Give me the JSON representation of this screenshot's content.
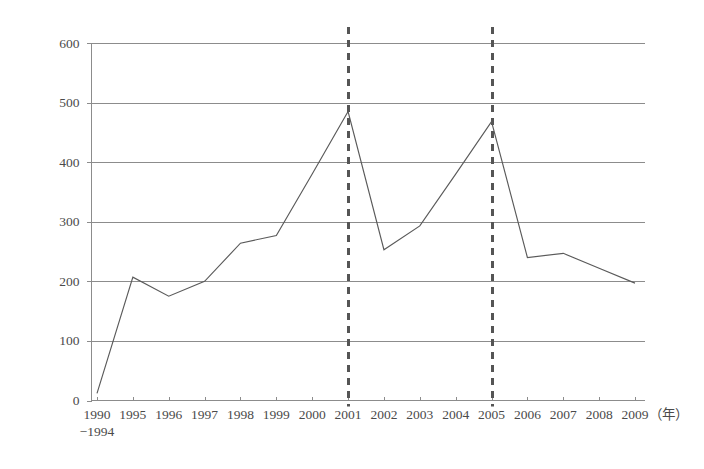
{
  "chart_data": {
    "type": "line",
    "title": "",
    "subtitle": "",
    "xlabel": "",
    "ylabel": "",
    "x_unit_label": "（年）",
    "categories": [
      "1990−1994",
      "1995",
      "1996",
      "1997",
      "1998",
      "1999",
      "2000",
      "2001",
      "2002",
      "2003",
      "2004",
      "2005",
      "2006",
      "2007",
      "2008",
      "2009"
    ],
    "category_lines": [
      [
        "1990",
        "−1994"
      ],
      [
        "1995"
      ],
      [
        "1996"
      ],
      [
        "1997"
      ],
      [
        "1998"
      ],
      [
        "1999"
      ],
      [
        "2000"
      ],
      [
        "2001"
      ],
      [
        "2002"
      ],
      [
        "2003"
      ],
      [
        "2004"
      ],
      [
        "2005"
      ],
      [
        "2006"
      ],
      [
        "2007"
      ],
      [
        "2008"
      ],
      [
        "2009"
      ]
    ],
    "values": [
      12,
      207,
      175,
      200,
      264,
      277,
      380,
      485,
      253,
      293,
      380,
      468,
      240,
      247,
      222,
      197
    ],
    "series": [
      {
        "name": "",
        "values": [
          12,
          207,
          175,
          200,
          264,
          277,
          380,
          485,
          253,
          293,
          380,
          468,
          240,
          247,
          222,
          197
        ]
      }
    ],
    "ylim": [
      0,
      600
    ],
    "ytick_values": [
      0,
      100,
      200,
      300,
      400,
      500,
      600
    ],
    "ytick_labels": [
      "0",
      "100",
      "200",
      "300",
      "400",
      "500",
      "600"
    ],
    "grid": true,
    "grid_axis": "y",
    "legend": false,
    "legend_position": "none",
    "annotations": [
      {
        "type": "vertical-reference-line",
        "name": "reference-line-2001",
        "category": "2001",
        "style": "dashed"
      },
      {
        "type": "vertical-reference-line",
        "name": "reference-line-2005",
        "category": "2005",
        "style": "dashed"
      }
    ],
    "colors": {
      "line": "#5a5a5a",
      "grid": "#8c8c8c",
      "axis": "#8c8c8c",
      "reference_line": "#555555",
      "background": "#ffffff",
      "text": "#4a4a4a"
    }
  }
}
